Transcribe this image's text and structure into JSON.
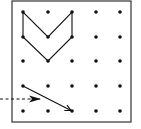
{
  "diagram": {
    "type": "dot-grid",
    "colors": {
      "ink": "#111111",
      "frame": "#333333",
      "background": "#ffffff"
    },
    "frame": {
      "x": 12,
      "y": 1,
      "width": 119,
      "height": 121
    },
    "grid": {
      "rows": 5,
      "cols": 5,
      "xs": [
        23,
        48,
        72,
        96,
        120
      ],
      "ys": [
        12,
        37,
        61,
        86,
        111
      ],
      "dot_radius": 1.8
    },
    "shape": {
      "name": "chevron-polygon",
      "points_grid": [
        [
          0,
          0
        ],
        [
          0,
          1
        ],
        [
          1,
          2
        ],
        [
          2,
          1
        ],
        [
          2,
          0
        ],
        [
          1,
          1
        ]
      ]
    },
    "solid_arrow": {
      "from_grid": [
        0,
        3
      ],
      "to_grid": [
        2,
        4
      ]
    },
    "dashed_arrow": {
      "x1": 0,
      "y1": 99,
      "x2": 40,
      "y2": 99
    }
  }
}
